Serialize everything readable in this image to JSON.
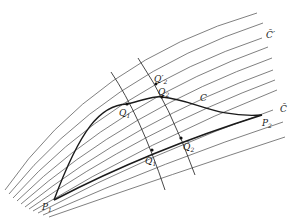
{
  "figure": {
    "type": "geometric-diagram",
    "labels": {
      "C_bar_prime": "C̄′",
      "C_bar": "C̄",
      "C": "C",
      "P1": "P",
      "P1_sub": "1",
      "P2": "P",
      "P2_sub": "2",
      "Q1": "Q",
      "Q1_sub": "1",
      "Q2": "Q",
      "Q2_sub": "2",
      "Q2_prime": "Q′",
      "Q2_prime_sub": "2",
      "Q1_bar": "Q̄",
      "Q1_bar_sub": "1",
      "Q2_bar": "Q̄",
      "Q2_bar_sub": "2"
    },
    "points": {
      "P1": [
        54,
        200
      ],
      "P2": [
        262,
        115
      ],
      "Q1": [
        127,
        104
      ],
      "Q2": [
        162,
        97
      ],
      "Q2_prime": [
        156,
        84
      ],
      "Q1_bar": [
        152,
        150
      ],
      "Q2_bar": [
        181,
        138
      ]
    },
    "family_curve_count": 11
  }
}
